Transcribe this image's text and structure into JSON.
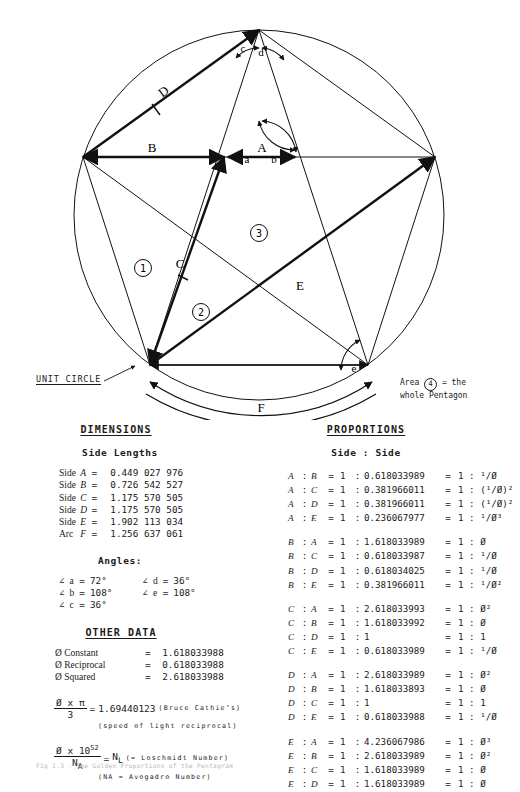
{
  "figure": {
    "unit_circle_label": "UNIT CIRCLE",
    "area_note_line1_prefix": "Area ",
    "area_note_circled": "4",
    "area_note_line1_suffix": " = the",
    "area_note_line2": "whole Pentagon",
    "side_labels": [
      "A",
      "B",
      "C",
      "D",
      "E",
      "F"
    ],
    "angle_labels": [
      "a",
      "b",
      "c",
      "d",
      "e"
    ],
    "region_numbers": [
      "1",
      "2",
      "3"
    ]
  },
  "dimensions": {
    "heading": "DIMENSIONS",
    "subheading": "Side Lengths",
    "rows": [
      {
        "kind": "Side",
        "name": "A",
        "eq": "=",
        "value": "0.449 027 976"
      },
      {
        "kind": "Side",
        "name": "B",
        "eq": "=",
        "value": "0.726 542 527"
      },
      {
        "kind": "Side",
        "name": "C",
        "eq": "=",
        "value": "1.175 570 505"
      },
      {
        "kind": "Side",
        "name": "D",
        "eq": "=",
        "value": "1.175 570 505"
      },
      {
        "kind": "Side",
        "name": "E",
        "eq": "=",
        "value": "1.902 113 034"
      },
      {
        "kind": "Arc",
        "name": "F",
        "eq": "=",
        "value": "1.256 637 061"
      }
    ],
    "angles_subheading": "Angles:",
    "angles": [
      {
        "sym": "∠",
        "name": "a",
        "eq": "=",
        "value": "72°",
        "sym2": "∠",
        "name2": "d",
        "eq2": "=",
        "value2": "36°"
      },
      {
        "sym": "∠",
        "name": "b",
        "eq": "=",
        "value": "108°",
        "sym2": "∠",
        "name2": "e",
        "eq2": "=",
        "value2": "108°"
      },
      {
        "sym": "∠",
        "name": "c",
        "eq": "=",
        "value": "36°",
        "sym2": "",
        "name2": "",
        "eq2": "",
        "value2": ""
      }
    ],
    "other_heading": "OTHER DATA",
    "other_rows": [
      {
        "label": "Ø Constant",
        "eq": "=",
        "value": "1.618033988"
      },
      {
        "label": "Ø Reciprocal",
        "eq": "=",
        "value": "0.618033988"
      },
      {
        "label": "Ø Squared",
        "eq": "=",
        "value": "2.618033988"
      }
    ],
    "formula1": {
      "numerator": "Ø x π",
      "denominator": "3",
      "eq": "=",
      "value": "1.69440123",
      "note": "(Bruce Cathie’s)",
      "note2": "(speed of light reciprocal)"
    },
    "formula2": {
      "numerator": "Ø x 10",
      "numerator_exp": "52",
      "denominator": "N",
      "denominator_sub": "A",
      "eq": "=",
      "value": "N",
      "value_sub": "L",
      "note": "(= Loschmidt Number)",
      "note2": "(NA = Avogadro Number)"
    }
  },
  "proportions": {
    "heading": "PROPORTIONS",
    "subheading": "Side : Side",
    "groups": [
      [
        {
          "a": "A",
          "b": "B",
          "eq": "=",
          "one": "1",
          "val": "0.618033989",
          "eq2": "=",
          "one2": "1",
          "ratio": "¹/Ø"
        },
        {
          "a": "A",
          "b": "C",
          "eq": "=",
          "one": "1",
          "val": "0.381966011",
          "eq2": "=",
          "one2": "1",
          "ratio": "(¹/Ø)²"
        },
        {
          "a": "A",
          "b": "D",
          "eq": "=",
          "one": "1",
          "val": "0.381966011",
          "eq2": "=",
          "one2": "1",
          "ratio": "(¹/Ø)²"
        },
        {
          "a": "A",
          "b": "E",
          "eq": "=",
          "one": "1",
          "val": "0.236067977",
          "eq2": "=",
          "one2": "1",
          "ratio": "¹/Ø³"
        }
      ],
      [
        {
          "a": "B",
          "b": "A",
          "eq": "=",
          "one": "1",
          "val": "1.618033989",
          "eq2": "=",
          "one2": "1",
          "ratio": "Ø"
        },
        {
          "a": "B",
          "b": "C",
          "eq": "=",
          "one": "1",
          "val": "0.618033987",
          "eq2": "=",
          "one2": "1",
          "ratio": "¹/Ø"
        },
        {
          "a": "B",
          "b": "D",
          "eq": "=",
          "one": "1",
          "val": "0.618034025",
          "eq2": "=",
          "one2": "1",
          "ratio": "¹/Ø"
        },
        {
          "a": "B",
          "b": "E",
          "eq": "=",
          "one": "1",
          "val": "0.381966011",
          "eq2": "=",
          "one2": "1",
          "ratio": "¹/Ø²"
        }
      ],
      [
        {
          "a": "C",
          "b": "A",
          "eq": "=",
          "one": "1",
          "val": "2.618033993",
          "eq2": "=",
          "one2": "1",
          "ratio": "Ø²"
        },
        {
          "a": "C",
          "b": "B",
          "eq": "=",
          "one": "1",
          "val": "1.618033992",
          "eq2": "=",
          "one2": "1",
          "ratio": "Ø"
        },
        {
          "a": "C",
          "b": "D",
          "eq": "=",
          "one": "1",
          "val": "1",
          "eq2": "=",
          "one2": "1",
          "ratio": "1"
        },
        {
          "a": "C",
          "b": "E",
          "eq": "=",
          "one": "1",
          "val": "0.618033989",
          "eq2": "=",
          "one2": "1",
          "ratio": "¹/Ø"
        }
      ],
      [
        {
          "a": "D",
          "b": "A",
          "eq": "=",
          "one": "1",
          "val": "2.618033989",
          "eq2": "=",
          "one2": "1",
          "ratio": "Ø²"
        },
        {
          "a": "D",
          "b": "B",
          "eq": "=",
          "one": "1",
          "val": "1.618033893",
          "eq2": "=",
          "one2": "1",
          "ratio": "Ø"
        },
        {
          "a": "D",
          "b": "C",
          "eq": "=",
          "one": "1",
          "val": "1",
          "eq2": "=",
          "one2": "1",
          "ratio": "1"
        },
        {
          "a": "D",
          "b": "E",
          "eq": "=",
          "one": "1",
          "val": "0.618033988",
          "eq2": "=",
          "one2": "1",
          "ratio": "¹/Ø"
        }
      ],
      [
        {
          "a": "E",
          "b": "A",
          "eq": "=",
          "one": "1",
          "val": "4.236067986",
          "eq2": "=",
          "one2": "1",
          "ratio": "Ø³"
        },
        {
          "a": "E",
          "b": "B",
          "eq": "=",
          "one": "1",
          "val": "2.618033989",
          "eq2": "=",
          "one2": "1",
          "ratio": "Ø²"
        },
        {
          "a": "E",
          "b": "C",
          "eq": "=",
          "one": "1",
          "val": "1.618033989",
          "eq2": "=",
          "one2": "1",
          "ratio": "Ø"
        },
        {
          "a": "E",
          "b": "D",
          "eq": "=",
          "one": "1",
          "val": "1.618033989",
          "eq2": "=",
          "one2": "1",
          "ratio": "Ø"
        }
      ]
    ]
  },
  "caption": "Fig 1.3 - The Golden Proportions of the Pentagram"
}
